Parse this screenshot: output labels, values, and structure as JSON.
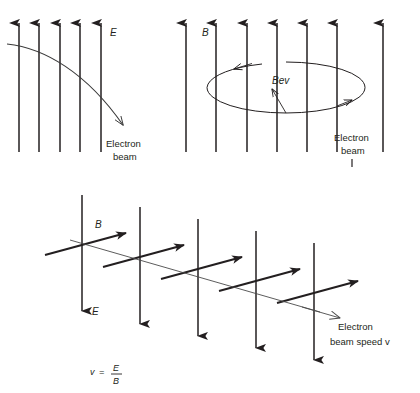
{
  "figure": {
    "background_color": "#ffffff",
    "ink_color": "#231f20",
    "panels": [
      {
        "id": "panel-electric",
        "name": "electric-field-deflection",
        "field_label": "E",
        "field_label_meaning": "electric field",
        "field_line_count": 5,
        "field_line_direction": "up",
        "beam_label_line1": "Electron",
        "beam_label_line2": "beam",
        "beam_path": "curved-deflected-downward"
      },
      {
        "id": "panel-magnetic",
        "name": "magnetic-field-circular-motion",
        "field_label": "B",
        "field_label_meaning": "magnetic field",
        "field_line_count": 7,
        "field_line_direction": "up",
        "force_label": "Bev",
        "force_label_meaning": "magnetic force on electron",
        "beam_label_line1": "Electron",
        "beam_label_line2": "beam",
        "beam_path": "circular-ellipse"
      },
      {
        "id": "panel-crossed-fields",
        "name": "crossed-fields-velocity-selector",
        "field_label_e": "E",
        "field_label_b": "B",
        "e_line_count": 5,
        "e_line_direction": "down",
        "b_arrow_count": 5,
        "b_arrow_direction": "up-right-diagonal",
        "beam_label_line1": "Electron",
        "beam_label_line2": "beam speed v",
        "beam_path": "straight-undeflected",
        "formula": {
          "lhs": "v",
          "equals": "=",
          "numerator": "E",
          "denominator": "B",
          "full": "v = E / B"
        }
      }
    ]
  }
}
